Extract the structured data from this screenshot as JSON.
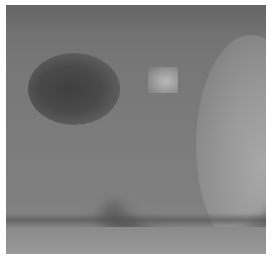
{
  "image": {
    "description": "Low-resolution grayscale blurry pixelated photograph with white border",
    "colors": {
      "border": "#ffffff",
      "base_gray": "#7a7a7a",
      "dark_region": "#444444",
      "bright_spot": "#b5b5b5",
      "light_region": "#a5a5a5"
    }
  }
}
